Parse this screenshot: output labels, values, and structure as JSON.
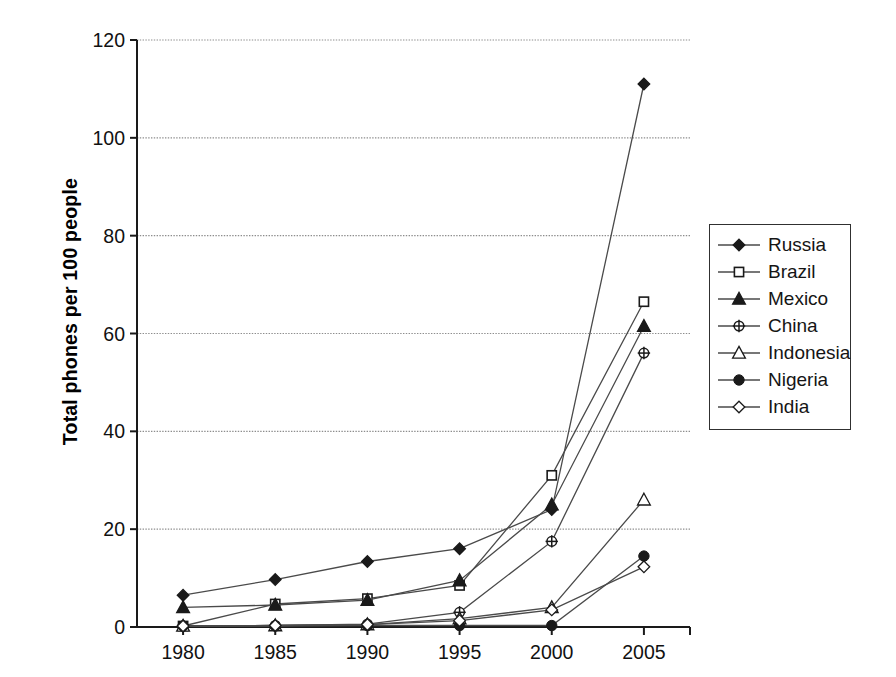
{
  "chart_data": {
    "type": "line",
    "title": "",
    "xlabel": "",
    "ylabel": "Total phones per 100 people",
    "x": [
      1980,
      1985,
      1990,
      1995,
      2000,
      2005
    ],
    "xtick_labels": [
      "1980",
      "1985",
      "1990",
      "1995",
      "2000",
      "2005"
    ],
    "ytick_labels": [
      "0",
      "20",
      "40",
      "60",
      "80",
      "100",
      "120"
    ],
    "yticks": [
      0,
      20,
      40,
      60,
      80,
      100,
      120
    ],
    "xlim": [
      1977.5,
      2007.5
    ],
    "ylim": [
      0,
      120
    ],
    "grid": "horizontal",
    "legend_position": "right",
    "series": [
      {
        "name": "Russia",
        "marker": "filled-diamond",
        "values": [
          6.5,
          9.7,
          13.4,
          16.0,
          24.0,
          111.0
        ]
      },
      {
        "name": "Brazil",
        "marker": "open-square",
        "values": [
          0.2,
          4.7,
          5.8,
          8.5,
          31.0,
          66.5
        ]
      },
      {
        "name": "Mexico",
        "marker": "filled-triangle",
        "values": [
          4.0,
          4.5,
          5.5,
          9.5,
          25.0,
          61.5
        ]
      },
      {
        "name": "China",
        "marker": "open-circle-plus",
        "values": [
          0.2,
          0.3,
          0.6,
          3.0,
          17.5,
          56.0
        ]
      },
      {
        "name": "Indonesia",
        "marker": "open-triangle",
        "values": [
          0.2,
          0.3,
          0.5,
          1.7,
          4.0,
          26.0
        ]
      },
      {
        "name": "Nigeria",
        "marker": "filled-circle",
        "values": [
          0.2,
          0.2,
          0.3,
          0.3,
          0.3,
          14.5
        ]
      },
      {
        "name": "India",
        "marker": "open-diamond",
        "values": [
          0.2,
          0.3,
          0.5,
          1.3,
          3.5,
          12.3
        ]
      }
    ]
  },
  "colors": {
    "line": "#4a4a4a",
    "marker_fill": "#1a1a1a",
    "marker_open": "#ffffff",
    "axis": "#1a1a1a",
    "grid": "#8d8d8d",
    "text": "#111111",
    "background": "#ffffff"
  }
}
